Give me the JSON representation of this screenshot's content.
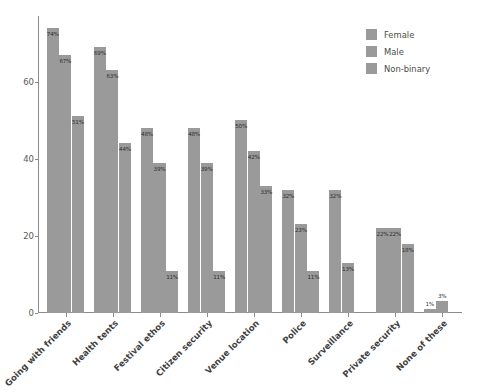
{
  "chart_data": {
    "type": "bar",
    "title": "",
    "subtitle": "",
    "xlabel": "",
    "ylabel": "",
    "ylim": [
      0,
      77
    ],
    "yticks": [
      0,
      20,
      40,
      60
    ],
    "grid": false,
    "legend_position": "top-right",
    "orientation": "vertical",
    "grouping": "grouped",
    "value_suffix": "%",
    "categories": [
      "Going with friends",
      "Health tents",
      "Festival ethos",
      "Citizen security",
      "Venue location",
      "Police",
      "Surveillance",
      "Private security",
      "None of these"
    ],
    "series": [
      {
        "name": "Female",
        "color": "#9a9a9a",
        "values": [
          74,
          69,
          48,
          48,
          50,
          32,
          32,
          22,
          1
        ],
        "labels": [
          "74%",
          "69%",
          "48%",
          "48%",
          "50%",
          "32%",
          "32%",
          "22%",
          "1%"
        ]
      },
      {
        "name": "Male",
        "color": "#9a9a9a",
        "values": [
          67,
          63,
          39,
          39,
          42,
          23,
          13,
          22,
          3
        ],
        "labels": [
          "67%",
          "63%",
          "39%",
          "39%",
          "42%",
          "23%",
          "13%",
          "22%",
          "3%"
        ]
      },
      {
        "name": "Non-binary",
        "color": "#9a9a9a",
        "values": [
          51,
          44,
          11,
          11,
          33,
          11,
          null,
          18,
          null
        ],
        "labels": [
          "51%",
          "44%",
          "11%",
          "11%",
          "33%",
          "11%",
          "",
          "18%",
          ""
        ]
      }
    ]
  },
  "legend": {
    "items": [
      {
        "label": "Female"
      },
      {
        "label": "Male"
      },
      {
        "label": "Non-binary"
      }
    ]
  },
  "axes": {
    "y_tick_labels": [
      "0",
      "20",
      "40",
      "60"
    ]
  }
}
